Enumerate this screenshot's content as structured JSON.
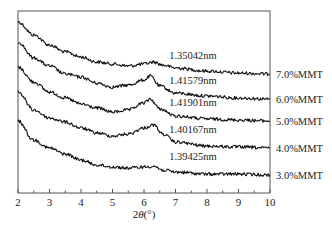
{
  "chart_data": {
    "type": "line",
    "title": "",
    "xlabel": "2θ(°)",
    "ylabel": "",
    "xlim": [
      2,
      10
    ],
    "ylim": [
      0,
      100
    ],
    "y_units": "relative intensity (a.u., vertically offset)",
    "x_ticks": [
      2,
      3,
      4,
      5,
      6,
      7,
      8,
      9,
      10
    ],
    "x_minor_step": 0.5,
    "grid": false,
    "legend_position": "right, inline labels at curve ends",
    "series": [
      {
        "name": "7.0%MMT",
        "annotation": "1.35042nm",
        "x": [
          2.0,
          2.5,
          3.0,
          3.5,
          4.0,
          4.5,
          5.0,
          5.5,
          6.0,
          6.3,
          6.6,
          7.0,
          8.0,
          9.0,
          10.0
        ],
        "values": [
          94.0,
          86.8,
          81.3,
          77.5,
          74.7,
          72.0,
          70.9,
          69.8,
          70.9,
          72.0,
          70.3,
          68.7,
          67.0,
          65.9,
          65.4
        ]
      },
      {
        "name": "6.0%MMT",
        "annotation": "1.41579nm",
        "x": [
          2.0,
          2.5,
          3.0,
          3.5,
          4.0,
          4.5,
          5.0,
          5.5,
          6.0,
          6.2,
          6.5,
          7.0,
          8.0,
          9.0,
          10.0
        ],
        "values": [
          83.0,
          74.2,
          69.8,
          65.4,
          63.7,
          60.4,
          58.2,
          59.3,
          62.1,
          64.3,
          58.8,
          54.9,
          53.3,
          52.2,
          51.6
        ]
      },
      {
        "name": "5.0%MMT",
        "annotation": "1.41901nm",
        "x": [
          2.0,
          2.5,
          3.0,
          3.5,
          4.0,
          4.5,
          5.0,
          5.5,
          6.0,
          6.2,
          6.5,
          7.0,
          8.0,
          9.0,
          10.0
        ],
        "values": [
          69.2,
          61.0,
          55.5,
          52.2,
          48.9,
          46.7,
          44.5,
          45.6,
          49.5,
          51.6,
          46.2,
          42.3,
          40.7,
          40.1,
          39.6
        ]
      },
      {
        "name": "4.0%MMT",
        "annotation": "1.40167nm",
        "x": [
          2.0,
          2.5,
          3.0,
          3.5,
          4.0,
          4.5,
          5.0,
          5.5,
          6.0,
          6.3,
          6.6,
          7.0,
          8.0,
          9.0,
          10.0
        ],
        "values": [
          55.5,
          45.6,
          41.2,
          39.0,
          35.7,
          33.0,
          31.3,
          32.4,
          35.7,
          37.4,
          32.4,
          28.0,
          25.8,
          25.3,
          24.7
        ]
      },
      {
        "name": "3.0%MMT",
        "annotation": "1.39425nm",
        "x": [
          2.0,
          2.5,
          3.0,
          3.5,
          4.0,
          4.5,
          5.0,
          5.5,
          6.0,
          6.3,
          6.6,
          7.0,
          8.0,
          9.0,
          10.0
        ],
        "values": [
          39.6,
          29.1,
          24.7,
          21.4,
          18.1,
          15.4,
          14.3,
          13.7,
          14.3,
          14.8,
          12.6,
          11.5,
          10.4,
          10.4,
          9.9
        ]
      }
    ],
    "annotations": [
      {
        "text": "1.35042nm",
        "x": 6.8,
        "near_series": "7.0%MMT"
      },
      {
        "text": "1.41579nm",
        "x": 6.8,
        "near_series": "6.0%MMT"
      },
      {
        "text": "1.41901nm",
        "x": 6.8,
        "near_series": "5.0%MMT"
      },
      {
        "text": "1.40167nm",
        "x": 6.8,
        "near_series": "4.0%MMT"
      },
      {
        "text": "1.39425nm",
        "x": 6.8,
        "near_series": "3.0%MMT"
      }
    ]
  },
  "axis": {
    "xlabel_prefix": "2",
    "xlabel_theta": "θ",
    "xlabel_unit": "(°)"
  }
}
